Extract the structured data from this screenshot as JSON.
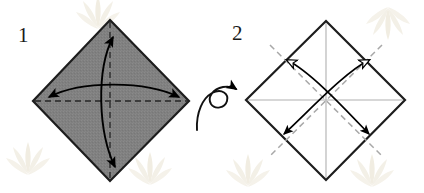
{
  "figure": {
    "type": "origami-instruction-diagram",
    "background_color": "#ffffff",
    "paper_front_color": "#808080",
    "paper_back_color": "#ffffff",
    "outline_color": "#1a1a1a",
    "crease_color": "#9a9a9a",
    "arrow_color": "#000000",
    "watermark_color": "#f2efe6"
  },
  "steps": [
    {
      "id": "step-1",
      "number": "1",
      "number_position": {
        "x": 18,
        "y": 42
      },
      "shape": "diamond",
      "filled": true,
      "fill_color": "#808080",
      "vertices": {
        "top": [
          110,
          20
        ],
        "right": [
          189,
          101
        ],
        "bottom": [
          110,
          181
        ],
        "left": [
          33,
          101
        ]
      },
      "creases": [
        {
          "name": "vertical-crease",
          "style": "dashed",
          "from": [
            110,
            20
          ],
          "to": [
            110,
            181
          ]
        },
        {
          "name": "horizontal-crease",
          "style": "dashed",
          "from": [
            33,
            101
          ],
          "to": [
            189,
            101
          ]
        }
      ],
      "arrows": [
        {
          "name": "vertical-fold-arrow",
          "style": "curved-double-headed",
          "head_fill": "solid",
          "from": [
            113,
            36
          ],
          "to": [
            115,
            168
          ]
        },
        {
          "name": "horizontal-fold-arrow",
          "style": "curved-double-headed",
          "head_fill": "solid",
          "from": [
            47,
            97
          ],
          "to": [
            180,
            97
          ]
        }
      ]
    },
    {
      "id": "step-2",
      "number": "2",
      "number_position": {
        "x": 232,
        "y": 40
      },
      "shape": "diamond",
      "filled": false,
      "fill_color": "#ffffff",
      "vertices": {
        "top": [
          326,
          21
        ],
        "right": [
          405,
          100
        ],
        "bottom": [
          326,
          180
        ],
        "left": [
          246,
          100
        ]
      },
      "creases": [
        {
          "name": "vertical-crease",
          "style": "solid-light",
          "from": [
            326,
            21
          ],
          "to": [
            326,
            180
          ]
        },
        {
          "name": "horizontal-crease",
          "style": "solid-light",
          "from": [
            246,
            100
          ],
          "to": [
            405,
            100
          ]
        },
        {
          "name": "diagonal-crease-nw-se",
          "style": "dashed-light",
          "from": [
            270,
            45
          ],
          "to": [
            382,
            157
          ]
        },
        {
          "name": "diagonal-crease-ne-sw",
          "style": "dashed-light",
          "from": [
            382,
            45
          ],
          "to": [
            270,
            157
          ]
        }
      ],
      "arrows": [
        {
          "name": "diagonal-fold-arrow-ne",
          "style": "curved-double-headed",
          "head_fill_start": "hollow",
          "head_fill_end": "solid",
          "from": [
            370,
            58
          ],
          "to": [
            281,
            137
          ]
        },
        {
          "name": "diagonal-fold-arrow-nw",
          "style": "curved-double-headed",
          "head_fill_start": "hollow",
          "head_fill_end": "solid",
          "from": [
            285,
            58
          ],
          "to": [
            371,
            137
          ]
        }
      ]
    }
  ],
  "transition": {
    "name": "turn-over-symbol",
    "label": "turn over",
    "symbol": "loop-arrow",
    "position": {
      "x": 196,
      "y": 95
    },
    "arrow_head_fill": "solid"
  },
  "watermarks": [
    {
      "name": "watermark-top-left",
      "x": 78,
      "y": -6
    },
    {
      "name": "watermark-bottom-left",
      "x": 8,
      "y": 140
    },
    {
      "name": "watermark-bottom-center",
      "x": 228,
      "y": 152
    },
    {
      "name": "watermark-bottom-right",
      "x": 352,
      "y": 152
    },
    {
      "name": "watermark-top-right",
      "x": 368,
      "y": 2
    }
  ]
}
